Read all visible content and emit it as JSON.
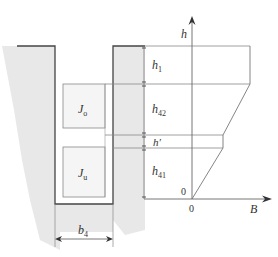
{
  "diagram": {
    "type": "slot-flux-density-profile",
    "labels": {
      "h_axis": "h",
      "b_axis": "B",
      "origin_h": "0",
      "origin_b": "0",
      "dim_h1": "h",
      "dim_h1_sub": "1",
      "dim_h42": "h",
      "dim_h42_sub": "42",
      "dim_hprime": "h′",
      "dim_h41": "h",
      "dim_h41_sub": "41",
      "width_b4": "b",
      "width_b4_sub": "4",
      "upper_conductor": "J",
      "upper_conductor_sub": "o",
      "lower_conductor": "J",
      "lower_conductor_sub": "u"
    },
    "regions": [
      {
        "name": "h1",
        "profile": "constant-max"
      },
      {
        "name": "h42",
        "profile": "linear-decrease"
      },
      {
        "name": "h'",
        "profile": "constant"
      },
      {
        "name": "h41",
        "profile": "linear-to-zero"
      }
    ],
    "colors": {
      "iron": "#e6e6e6",
      "line": "#555555",
      "thin_line": "#8a8a8a"
    }
  }
}
